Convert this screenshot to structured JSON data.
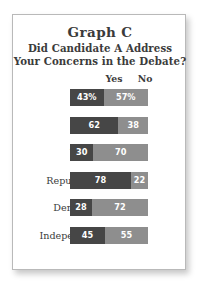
{
  "card": {
    "title": "Graph C",
    "subtitle_lines": [
      "Did Candidate A Address",
      "Your Concerns in the Debate?"
    ]
  },
  "chart_data": {
    "type": "bar",
    "title": "Graph C",
    "subtitle": "Did Candidate A Address Your Concerns in the Debate?",
    "orientation": "horizontal",
    "stacked": true,
    "centered_on_axis": true,
    "xlabel": "",
    "ylabel": "",
    "xlim": [
      0,
      100
    ],
    "grid": false,
    "legend_position": "top",
    "legend": [
      "Yes",
      "No"
    ],
    "colors": {
      "yes": "#464646",
      "no": "#8e8e8e",
      "value_text": "#ffffff",
      "label_text": "#3b3b3b",
      "card_background": "#ffffff",
      "card_border": "#b9b9b9"
    },
    "categories": [
      "Total",
      "Men",
      "Women",
      "Republicans",
      "Democrats",
      "Independents"
    ],
    "series": [
      {
        "name": "Yes",
        "values": [
          43,
          62,
          30,
          78,
          28,
          45
        ]
      },
      {
        "name": "No",
        "values": [
          57,
          38,
          70,
          22,
          72,
          55
        ]
      }
    ],
    "rows": [
      {
        "label": "Total",
        "yes": 43,
        "no": 57,
        "yes_text": "43%",
        "no_text": "57%"
      },
      {
        "label": "Men",
        "yes": 62,
        "no": 38,
        "yes_text": "62",
        "no_text": "38"
      },
      {
        "label": "Women",
        "yes": 30,
        "no": 70,
        "yes_text": "30",
        "no_text": "70"
      },
      {
        "label": "Republicans",
        "yes": 78,
        "no": 22,
        "yes_text": "78",
        "no_text": "22"
      },
      {
        "label": "Democrats",
        "yes": 28,
        "no": 72,
        "yes_text": "28",
        "no_text": "72"
      },
      {
        "label": "Independents",
        "yes": 45,
        "no": 55,
        "yes_text": "45",
        "no_text": "55"
      }
    ]
  }
}
